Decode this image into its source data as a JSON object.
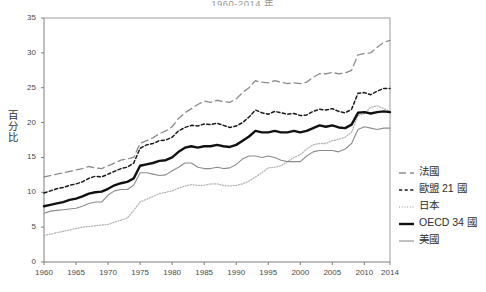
{
  "chart_data": {
    "type": "line",
    "title": "1960-2014 年",
    "xlabel": "",
    "ylabel": "百分比",
    "xlim": [
      1960,
      2014
    ],
    "ylim": [
      0,
      35
    ],
    "ytick_labels": [
      "0",
      "5",
      "10",
      "15",
      "20",
      "25",
      "30",
      "35"
    ],
    "yticks": [
      0,
      5,
      10,
      15,
      20,
      25,
      30,
      35
    ],
    "xtick_labels": [
      "1960",
      "1965",
      "1970",
      "1975",
      "1980",
      "1985",
      "1990",
      "1995",
      "2000",
      "2005",
      "2010",
      "2014"
    ],
    "xticks": [
      1960,
      1965,
      1970,
      1975,
      1980,
      1985,
      1990,
      1995,
      2000,
      2005,
      2010,
      2014
    ],
    "grid": false,
    "legend_position": "right",
    "x": [
      1960,
      1961,
      1962,
      1963,
      1964,
      1965,
      1966,
      1967,
      1968,
      1969,
      1970,
      1971,
      1972,
      1973,
      1974,
      1975,
      1976,
      1977,
      1978,
      1979,
      1980,
      1981,
      1982,
      1983,
      1984,
      1985,
      1986,
      1987,
      1988,
      1989,
      1990,
      1991,
      1992,
      1993,
      1994,
      1995,
      1996,
      1997,
      1998,
      1999,
      2000,
      2001,
      2002,
      2003,
      2004,
      2005,
      2006,
      2007,
      2008,
      2009,
      2010,
      2011,
      2012,
      2013,
      2014
    ],
    "series": [
      {
        "name": "法國",
        "style": "long-dash",
        "color": "#8c8c8c",
        "width": 1.3,
        "values": [
          12.2,
          12.4,
          12.6,
          12.8,
          13.0,
          13.2,
          13.4,
          13.7,
          13.5,
          13.4,
          13.8,
          14.2,
          14.6,
          14.8,
          15.0,
          17.0,
          17.4,
          17.8,
          18.4,
          18.8,
          19.4,
          20.6,
          21.4,
          22.0,
          22.6,
          23.1,
          22.9,
          23.2,
          23.0,
          22.9,
          23.4,
          24.3,
          25.0,
          26.0,
          25.8,
          25.7,
          26.0,
          25.8,
          25.6,
          25.7,
          25.6,
          25.8,
          26.5,
          27.0,
          27.0,
          27.2,
          27.0,
          27.1,
          27.5,
          29.7,
          29.9,
          30.0,
          30.8,
          31.5,
          31.8
        ]
      },
      {
        "name": "歐盟 21 國",
        "style": "short-dash",
        "color": "#1a1a1a",
        "width": 1.5,
        "values": [
          9.9,
          10.2,
          10.5,
          10.7,
          11.0,
          11.2,
          11.5,
          12.0,
          12.3,
          12.2,
          12.6,
          13.0,
          13.4,
          13.6,
          14.2,
          16.3,
          16.8,
          17.0,
          17.4,
          17.5,
          17.9,
          18.8,
          19.3,
          19.6,
          19.5,
          19.8,
          19.7,
          19.9,
          19.6,
          19.3,
          19.5,
          20.0,
          20.8,
          21.8,
          21.4,
          21.2,
          21.6,
          21.4,
          21.2,
          21.3,
          21.0,
          21.1,
          21.6,
          21.9,
          21.8,
          22.0,
          21.6,
          21.4,
          21.9,
          24.2,
          24.3,
          24.0,
          24.5,
          24.9,
          24.9
        ]
      },
      {
        "name": "日本",
        "style": "dotted",
        "color": "#b5b5b5",
        "width": 1.3,
        "values": [
          3.8,
          4.0,
          4.2,
          4.4,
          4.6,
          4.8,
          5.0,
          5.1,
          5.2,
          5.3,
          5.4,
          5.7,
          6.0,
          6.3,
          7.4,
          8.6,
          9.0,
          9.4,
          9.8,
          10.0,
          10.2,
          10.6,
          10.9,
          11.1,
          11.0,
          11.0,
          11.2,
          11.2,
          11.0,
          10.9,
          11.0,
          11.2,
          11.6,
          12.2,
          12.8,
          13.5,
          13.6,
          13.8,
          14.4,
          15.0,
          15.4,
          16.2,
          16.8,
          17.0,
          17.0,
          17.4,
          17.6,
          17.9,
          18.6,
          21.0,
          21.3,
          22.2,
          22.4,
          22.0,
          21.6
        ]
      },
      {
        "name": "OECD 34 國",
        "style": "solid",
        "color": "#111111",
        "width": 2.4,
        "values": [
          8.0,
          8.2,
          8.4,
          8.6,
          8.9,
          9.1,
          9.4,
          9.8,
          10.0,
          10.1,
          10.5,
          11.0,
          11.3,
          11.5,
          12.0,
          13.8,
          14.0,
          14.2,
          14.5,
          14.6,
          15.0,
          15.8,
          16.4,
          16.6,
          16.4,
          16.6,
          16.6,
          16.8,
          16.6,
          16.5,
          16.8,
          17.4,
          18.0,
          18.8,
          18.6,
          18.6,
          18.8,
          18.6,
          18.6,
          18.8,
          18.6,
          18.8,
          19.2,
          19.6,
          19.4,
          19.6,
          19.3,
          19.2,
          19.7,
          21.4,
          21.5,
          21.3,
          21.5,
          21.6,
          21.5
        ]
      },
      {
        "name": "美國",
        "style": "solid",
        "color": "#8c8c8c",
        "width": 1.1,
        "values": [
          7.0,
          7.3,
          7.4,
          7.5,
          7.6,
          7.7,
          8.0,
          8.4,
          8.6,
          8.6,
          9.6,
          10.2,
          10.4,
          10.4,
          11.0,
          12.8,
          12.8,
          12.6,
          12.4,
          12.5,
          13.1,
          13.6,
          14.2,
          14.2,
          13.6,
          13.4,
          13.4,
          13.6,
          13.4,
          13.5,
          14.0,
          14.8,
          15.2,
          15.2,
          15.0,
          15.2,
          15.0,
          14.6,
          14.4,
          14.4,
          14.4,
          15.2,
          15.8,
          16.0,
          16.0,
          16.0,
          15.8,
          16.2,
          17.0,
          19.0,
          19.4,
          19.2,
          19.0,
          19.2,
          19.2
        ]
      }
    ]
  },
  "legend": {
    "items": [
      {
        "label": "法國"
      },
      {
        "label": "歐盟 21 國"
      },
      {
        "label": "日本"
      },
      {
        "label": "OECD 34 國"
      },
      {
        "label": "美國"
      }
    ]
  }
}
